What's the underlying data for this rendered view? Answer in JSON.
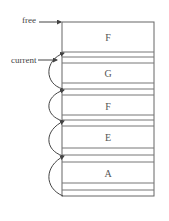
{
  "diagram": {
    "labels": {
      "free": "free",
      "current": "current"
    },
    "blocks": [
      {
        "label": "F",
        "top": 22,
        "bottom": 52
      },
      {
        "label": "G",
        "top": 63,
        "bottom": 83
      },
      {
        "label": "F",
        "top": 95,
        "bottom": 115
      },
      {
        "label": "E",
        "top": 126,
        "bottom": 148
      },
      {
        "label": "A",
        "top": 162,
        "bottom": 183
      }
    ],
    "colors": {
      "line": "#555555",
      "background": "#ffffff"
    }
  }
}
